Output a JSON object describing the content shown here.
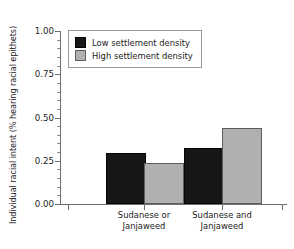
{
  "chart_data": {
    "type": "bar",
    "title": "",
    "subtitle": "",
    "xlabel": "",
    "ylabel": "Individual racial intent (% hearing racial epithets)",
    "categories": [
      "Sudanese or Janjaweed",
      "Sudanese and Janjaweed"
    ],
    "category_lines": [
      [
        "Sudanese or",
        "Janjaweed"
      ],
      [
        "Sudanese and",
        "Janjaweed"
      ]
    ],
    "series": [
      {
        "name": "Low settlement density",
        "color": "#171717",
        "values": [
          0.285,
          0.31
        ]
      },
      {
        "name": "High settlement density",
        "color": "#b0b0b0",
        "values": [
          0.225,
          0.425
        ]
      }
    ],
    "ylim": [
      0.0,
      1.0
    ],
    "yticks": [
      0.0,
      0.25,
      0.5,
      0.75,
      1.0
    ],
    "ytick_labels": [
      "0.00",
      "0.25",
      "0.50",
      "0.75",
      "1.00"
    ],
    "yminor_step": 0.05,
    "grid": false,
    "legend": {
      "position": "top-left",
      "entries": [
        {
          "label": "Low settlement density",
          "swatch": "dark"
        },
        {
          "label": "High settlement density",
          "swatch": "light"
        }
      ]
    },
    "colors": {
      "low_density": "#171717",
      "high_density": "#b0b0b0",
      "axis": "#6e6e6e",
      "text": "#1a1a1a",
      "background": "#ffffff"
    }
  }
}
